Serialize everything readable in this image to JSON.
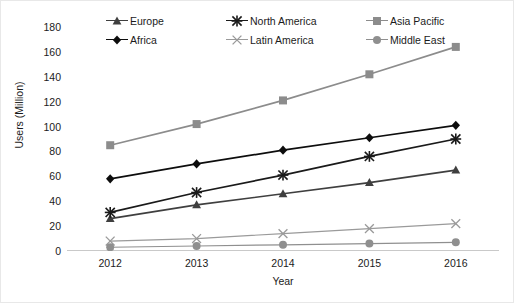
{
  "chart_data": {
    "type": "line",
    "title": "",
    "xlabel": "Year",
    "ylabel": "Users (Million)",
    "categories": [
      "2012",
      "2013",
      "2014",
      "2015",
      "2016"
    ],
    "ylim": [
      0,
      180
    ],
    "ytick_step": 20,
    "yticks": [
      "180",
      "160",
      "140",
      "120",
      "100",
      "80",
      "60",
      "40",
      "20",
      "0"
    ],
    "grid": false,
    "legend_position": "top",
    "series": [
      {
        "name": "Europe",
        "values": [
          26,
          37,
          46,
          55,
          65
        ],
        "color": "#3f3f3f",
        "marker": "triangle"
      },
      {
        "name": "North America",
        "values": [
          31,
          47,
          61,
          76,
          90
        ],
        "color": "#1a1a1a",
        "marker": "asterisk"
      },
      {
        "name": "Asia Pacific",
        "values": [
          85,
          102,
          121,
          142,
          164
        ],
        "color": "#8c8c8c",
        "marker": "square"
      },
      {
        "name": "Africa",
        "values": [
          58,
          70,
          81,
          91,
          101
        ],
        "color": "#0d0d0d",
        "marker": "diamond"
      },
      {
        "name": "Latin America",
        "values": [
          8,
          10,
          14,
          18,
          22
        ],
        "color": "#9a9a9a",
        "marker": "x"
      },
      {
        "name": "Middle East",
        "values": [
          3,
          4,
          5,
          6,
          7
        ],
        "color": "#8f8f8f",
        "marker": "circle"
      }
    ]
  },
  "legend": {
    "items": [
      {
        "label": "Europe",
        "series": 0
      },
      {
        "label": "North America",
        "series": 1
      },
      {
        "label": "Asia Pacific",
        "series": 2
      },
      {
        "label": "Africa",
        "series": 3
      },
      {
        "label": "Latin America",
        "series": 4
      },
      {
        "label": "Middle East",
        "series": 5
      }
    ]
  }
}
